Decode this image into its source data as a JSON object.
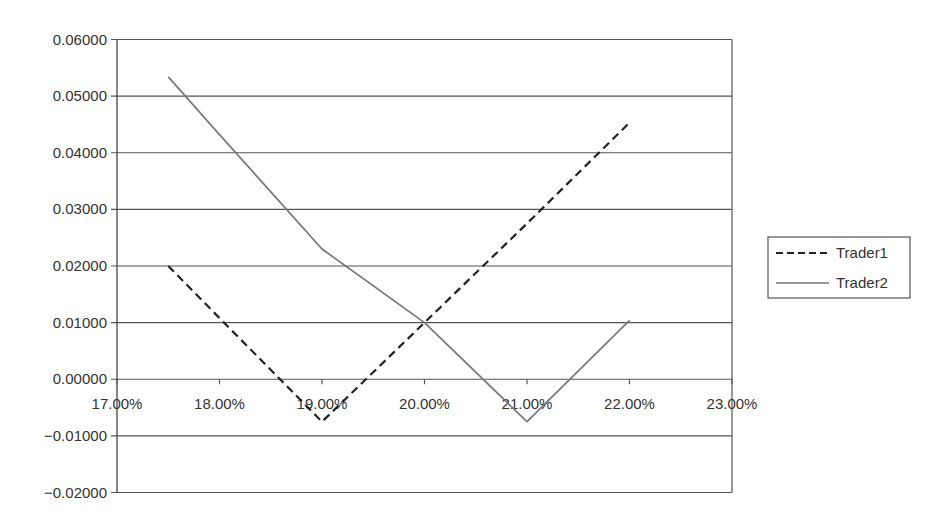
{
  "chart_data": {
    "type": "line",
    "title": "",
    "xlabel": "",
    "ylabel": "",
    "x_tick_labels": [
      "17.00%",
      "18.00%",
      "19.00%",
      "20.00%",
      "21.00%",
      "22.00%",
      "23.00%"
    ],
    "x_ticks": [
      17,
      18,
      19,
      20,
      21,
      22,
      23
    ],
    "y_tick_labels": [
      "0.06000",
      "0.05000",
      "0.04000",
      "0.03000",
      "0.02000",
      "0.01000",
      "0.00000",
      "−0.01000",
      "−0.02000"
    ],
    "y_ticks": [
      0.06,
      0.05,
      0.04,
      0.03,
      0.02,
      0.01,
      0.0,
      -0.01,
      -0.02
    ],
    "xlim": [
      17,
      23
    ],
    "ylim": [
      -0.02,
      0.06
    ],
    "grid": "horizontal",
    "legend_position": "right",
    "x": [
      17.5,
      18,
      19,
      20,
      21,
      22
    ],
    "series": [
      {
        "name": "Trader1",
        "style": "dashed",
        "color": "#222222",
        "values": [
          0.02,
          0.0108,
          -0.0075,
          0.01,
          0.0275,
          0.0453
        ]
      },
      {
        "name": "Trader2",
        "style": "solid",
        "color": "#777777",
        "values": [
          0.0534,
          0.0432,
          0.023,
          0.01,
          -0.0075,
          0.0104
        ]
      }
    ]
  },
  "legend": {
    "items": [
      {
        "label": "Trader1"
      },
      {
        "label": "Trader2"
      }
    ]
  }
}
